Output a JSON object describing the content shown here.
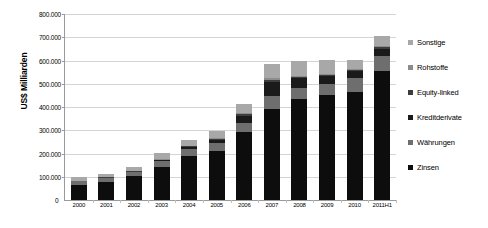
{
  "chart_data": {
    "type": "bar",
    "stacked": true,
    "title": "",
    "xlabel": "",
    "ylabel": "US$ Milliarden",
    "ylim": [
      0,
      800000
    ],
    "ytick_values": [
      0,
      100000,
      200000,
      300000,
      400000,
      500000,
      600000,
      700000,
      800000
    ],
    "ytick_labels": [
      "0",
      "100.000",
      "200.000",
      "300.000",
      "400.000",
      "500.000",
      "600.000",
      "700.000",
      "800.000"
    ],
    "grid": true,
    "legend_position": "right",
    "categories": [
      "2000",
      "2001",
      "2002",
      "2003",
      "2004",
      "2005",
      "2006",
      "2007",
      "2008",
      "2009",
      "2010",
      "2011H1"
    ],
    "series": [
      {
        "name": "Zinsen",
        "color": "#0d0d0d",
        "values": [
          64700,
          77500,
          101700,
          141900,
          190500,
          211900,
          291600,
          393100,
          432700,
          449900,
          465300,
          553900
        ]
      },
      {
        "name": "Währungen",
        "color": "#6e6e6e",
        "values": [
          15700,
          16700,
          18400,
          24500,
          29300,
          31400,
          40300,
          56200,
          50000,
          49200,
          57800,
          64700
        ]
      },
      {
        "name": "Kreditderivate",
        "color": "#1a1a1a",
        "values": [
          900,
          1200,
          2200,
          3800,
          6400,
          13900,
          28700,
          58200,
          41900,
          32700,
          29900,
          32400
        ]
      },
      {
        "name": "Equity-linked",
        "color": "#3d3d3d",
        "values": [
          1900,
          1900,
          2300,
          3800,
          4400,
          5800,
          7500,
          8500,
          6500,
          5900,
          5600,
          6800
        ]
      },
      {
        "name": "Rohstoffe",
        "color": "#8c8c8c",
        "values": [
          700,
          600,
          900,
          1400,
          1400,
          5400,
          7100,
          8500,
          4400,
          2900,
          2900,
          3200
        ]
      },
      {
        "name": "Sonstige",
        "color": "#a8a8a8",
        "values": [
          14400,
          14400,
          18300,
          25500,
          25900,
          29200,
          39700,
          61700,
          62700,
          63300,
          39500,
          42600
        ]
      }
    ]
  },
  "axis": {
    "zero_label": "0"
  },
  "legend": {
    "items": [
      {
        "label": "Sonstige",
        "color": "#a8a8a8"
      },
      {
        "label": "Rohstoffe",
        "color": "#8c8c8c"
      },
      {
        "label": "Equity-linked",
        "color": "#3d3d3d"
      },
      {
        "label": "Kreditderivate",
        "color": "#1a1a1a"
      },
      {
        "label": "Währungen",
        "color": "#6e6e6e"
      },
      {
        "label": "Zinsen",
        "color": "#0d0d0d"
      }
    ]
  }
}
